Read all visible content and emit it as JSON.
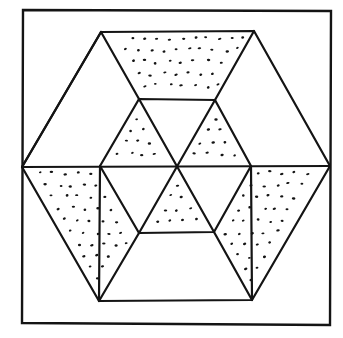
{
  "diagram": {
    "kind": "hexagonal quilt block",
    "colors": {
      "line": "#141414",
      "background": "#ffffff",
      "stipple": "#141414"
    },
    "regions": [
      {
        "id": "top-trapezoid",
        "shape": "trapezoid",
        "fill": "stippled"
      },
      {
        "id": "upper-left-triangle",
        "shape": "triangle",
        "fill": "plain"
      },
      {
        "id": "upper-right-triangle",
        "shape": "triangle",
        "fill": "plain"
      },
      {
        "id": "lower-left-parallelogram",
        "shape": "trapezoid",
        "fill": "stippled"
      },
      {
        "id": "lower-right-parallelogram",
        "shape": "trapezoid",
        "fill": "stippled"
      },
      {
        "id": "bottom-trapezoid",
        "shape": "trapezoid",
        "fill": "plain"
      },
      {
        "id": "inner-top-triangle",
        "shape": "triangle",
        "fill": "plain"
      },
      {
        "id": "inner-upper-left-triangle",
        "shape": "triangle",
        "fill": "stippled"
      },
      {
        "id": "inner-upper-right-triangle",
        "shape": "triangle",
        "fill": "stippled"
      },
      {
        "id": "inner-lower-left-triangle",
        "shape": "triangle",
        "fill": "plain"
      },
      {
        "id": "inner-lower-right-triangle",
        "shape": "triangle",
        "fill": "plain"
      },
      {
        "id": "inner-bottom-triangle",
        "shape": "triangle",
        "fill": "stippled"
      }
    ]
  }
}
